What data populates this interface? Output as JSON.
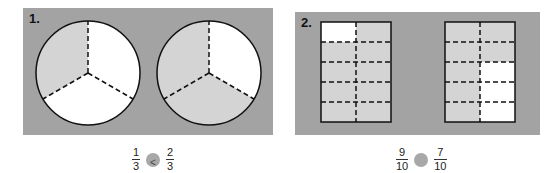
{
  "problems": [
    {
      "label": "1.",
      "shape": "circle",
      "figures": [
        {
          "parts": 3,
          "shaded": 1
        },
        {
          "parts": 3,
          "shaded": 2
        }
      ],
      "left": {
        "numerator": "1",
        "denominator": "3"
      },
      "answer_mark": "<",
      "right": {
        "numerator": "2",
        "denominator": "3"
      }
    },
    {
      "label": "2.",
      "shape": "rectangle",
      "figures": [
        {
          "parts": 10,
          "shaded": 9
        },
        {
          "parts": 10,
          "shaded": 7
        }
      ],
      "left": {
        "numerator": "9",
        "denominator": "10"
      },
      "answer_mark": "",
      "right": {
        "numerator": "7",
        "denominator": "10"
      }
    }
  ],
  "colors": {
    "panel_bg": "#a3a3a3",
    "shaded": "#d4d4d4",
    "unshaded": "#ffffff",
    "answer_circle": "#a8a8a8"
  }
}
